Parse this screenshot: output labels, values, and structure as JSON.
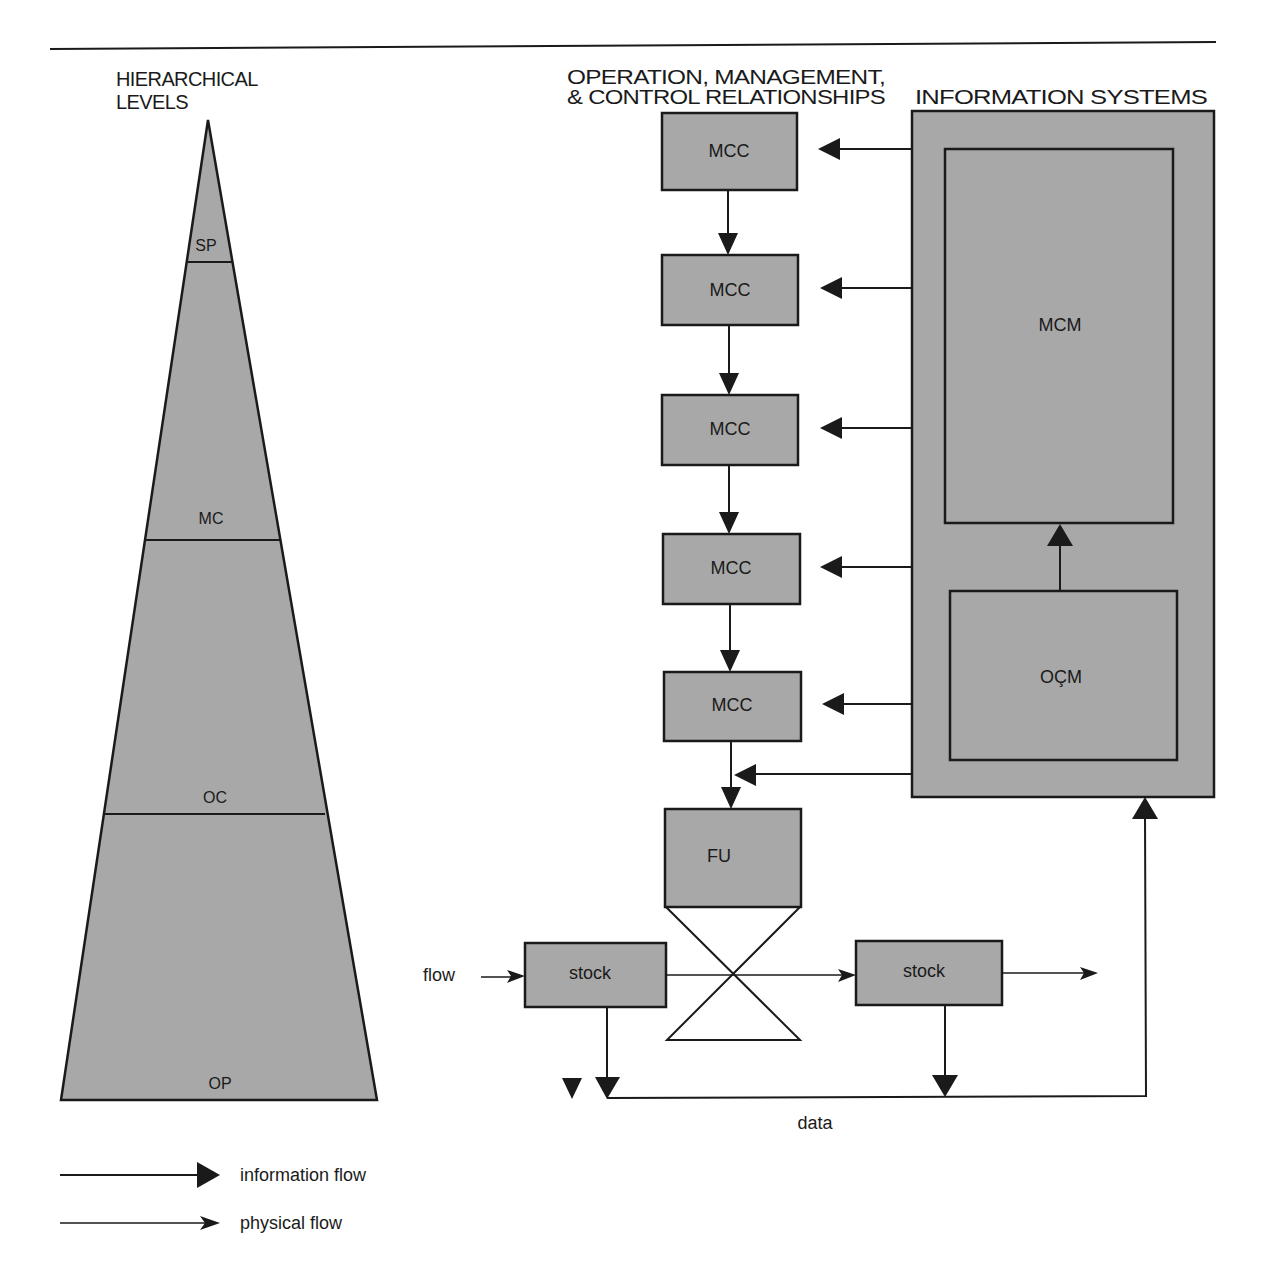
{
  "colors": {
    "box_fill": "#a8a8a8",
    "ink": "#1a1a1a",
    "background": "#ffffff"
  },
  "headers": {
    "hierarchy_line1": "HIERARCHICAL",
    "hierarchy_line2": "LEVELS",
    "omc_line1": "OPERATION, MANAGEMENT,",
    "omc_line2": "& CONTROL RELATIONSHIPS",
    "info_systems": "INFORMATION SYSTEMS"
  },
  "pyramid": {
    "levels": [
      {
        "label": "SP"
      },
      {
        "label": "MC"
      },
      {
        "label": "OC"
      },
      {
        "label": "OP"
      }
    ]
  },
  "control_chain": {
    "boxes": [
      {
        "label": "MCC"
      },
      {
        "label": "MCC"
      },
      {
        "label": "MCC"
      },
      {
        "label": "MCC"
      },
      {
        "label": "MCC"
      }
    ],
    "functional_unit": "FU"
  },
  "information_systems": {
    "upper_module": "MCM",
    "lower_module": "OÇM"
  },
  "physical": {
    "input_label": "flow",
    "stock_in": "stock",
    "stock_out": "stock",
    "data_label": "data"
  },
  "legend": {
    "items": [
      {
        "label": "information flow",
        "type": "information"
      },
      {
        "label": "physical flow",
        "type": "physical"
      }
    ]
  }
}
